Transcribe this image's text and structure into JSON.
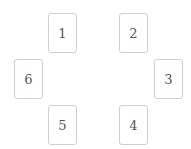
{
  "cards": [
    {
      "label": "1",
      "x": 48,
      "y": 13
    },
    {
      "label": "2",
      "x": 119,
      "y": 13
    },
    {
      "label": "3",
      "x": 154,
      "y": 59
    },
    {
      "label": "4",
      "x": 119,
      "y": 105
    },
    {
      "label": "5",
      "x": 48,
      "y": 105
    },
    {
      "label": "6",
      "x": 14,
      "y": 59
    }
  ],
  "colors": {
    "border": "#cfcfcf",
    "text": "#555555",
    "background": "#ffffff"
  }
}
